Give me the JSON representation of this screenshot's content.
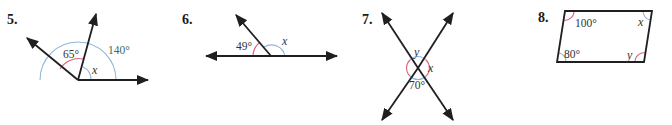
{
  "problems": [
    {
      "number": "5.",
      "type": "adjacent-angles",
      "labels": {
        "angle_a": "65°",
        "angle_total": "140°",
        "unknown": "x"
      }
    },
    {
      "number": "6.",
      "type": "linear-pair",
      "labels": {
        "known": "49°",
        "unknown": "x"
      }
    },
    {
      "number": "7.",
      "type": "vertical-angles",
      "labels": {
        "top": "y",
        "right": "x",
        "bottom": "70°"
      }
    },
    {
      "number": "8.",
      "type": "parallelogram",
      "labels": {
        "top_left": "100°",
        "top_right": "x",
        "bottom_left": "80°",
        "bottom_right": "y"
      }
    }
  ],
  "colors": {
    "line": "#1f1f1f",
    "arc_blue": "#8fb4d6",
    "arc_red": "#e0607a",
    "label_green": "#3f6b5a"
  }
}
